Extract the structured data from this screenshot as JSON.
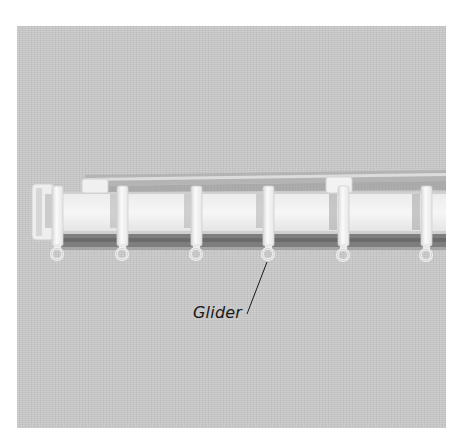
{
  "figure": {
    "callouts": [
      {
        "label": "Glider"
      }
    ],
    "colors": {
      "background": "#c9c9c9",
      "track": "#f2f2f2",
      "track_shadow": "#8f8f8f",
      "glider": "#f5f5f5",
      "callout_line": "#1a1a1a"
    },
    "gliders_visible": 6
  }
}
